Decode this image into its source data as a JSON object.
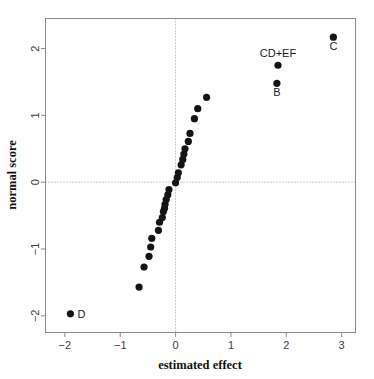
{
  "chart_data": {
    "type": "scatter",
    "title": "",
    "xlabel": "estimated effect",
    "ylabel": "normal score",
    "xlim": [
      -2.35,
      3.25
    ],
    "ylim": [
      -2.25,
      2.45
    ],
    "xticks": [
      -2,
      -1,
      0,
      1,
      2,
      3
    ],
    "xtick_labels": [
      "−2",
      "−1",
      "0",
      "1",
      "2",
      "3"
    ],
    "yticks": [
      -2,
      -1,
      0,
      1,
      2
    ],
    "ytick_labels": [
      "−2",
      "−1",
      "0",
      "1",
      "2"
    ],
    "grid": false,
    "reference_lines": [
      {
        "orientation": "vertical",
        "value": 0,
        "style": "dotted"
      },
      {
        "orientation": "horizontal",
        "value": 0,
        "style": "dotted"
      }
    ],
    "legend": null,
    "point_color": "#141414",
    "frame_color": "#8a8a8a",
    "points": [
      {
        "x": -1.9,
        "y": -1.97,
        "label": "D",
        "label_pos": "right"
      },
      {
        "x": -0.66,
        "y": -1.57,
        "label": "",
        "label_pos": ""
      },
      {
        "x": -0.57,
        "y": -1.27,
        "label": "",
        "label_pos": ""
      },
      {
        "x": -0.48,
        "y": -1.11,
        "label": "",
        "label_pos": ""
      },
      {
        "x": -0.45,
        "y": -0.97,
        "label": "",
        "label_pos": ""
      },
      {
        "x": -0.43,
        "y": -0.84,
        "label": "",
        "label_pos": ""
      },
      {
        "x": -0.31,
        "y": -0.72,
        "label": "",
        "label_pos": ""
      },
      {
        "x": -0.29,
        "y": -0.6,
        "label": "",
        "label_pos": ""
      },
      {
        "x": -0.24,
        "y": -0.53,
        "label": "",
        "label_pos": ""
      },
      {
        "x": -0.22,
        "y": -0.44,
        "label": "",
        "label_pos": ""
      },
      {
        "x": -0.2,
        "y": -0.39,
        "label": "",
        "label_pos": ""
      },
      {
        "x": -0.19,
        "y": -0.33,
        "label": "",
        "label_pos": ""
      },
      {
        "x": -0.17,
        "y": -0.26,
        "label": "",
        "label_pos": ""
      },
      {
        "x": -0.14,
        "y": -0.19,
        "label": "",
        "label_pos": ""
      },
      {
        "x": -0.12,
        "y": -0.11,
        "label": "",
        "label_pos": ""
      },
      {
        "x": 0.0,
        "y": -0.01,
        "label": "",
        "label_pos": ""
      },
      {
        "x": 0.03,
        "y": 0.07,
        "label": "",
        "label_pos": ""
      },
      {
        "x": 0.05,
        "y": 0.14,
        "label": "",
        "label_pos": ""
      },
      {
        "x": 0.1,
        "y": 0.26,
        "label": "",
        "label_pos": ""
      },
      {
        "x": 0.13,
        "y": 0.34,
        "label": "",
        "label_pos": ""
      },
      {
        "x": 0.15,
        "y": 0.42,
        "label": "",
        "label_pos": ""
      },
      {
        "x": 0.17,
        "y": 0.5,
        "label": "",
        "label_pos": ""
      },
      {
        "x": 0.23,
        "y": 0.61,
        "label": "",
        "label_pos": ""
      },
      {
        "x": 0.26,
        "y": 0.73,
        "label": "",
        "label_pos": ""
      },
      {
        "x": 0.34,
        "y": 0.95,
        "label": "",
        "label_pos": ""
      },
      {
        "x": 0.4,
        "y": 1.1,
        "label": "",
        "label_pos": ""
      },
      {
        "x": 0.56,
        "y": 1.27,
        "label": "",
        "label_pos": ""
      },
      {
        "x": 1.83,
        "y": 1.48,
        "label": "B",
        "label_pos": "below"
      },
      {
        "x": 1.85,
        "y": 1.75,
        "label": "CD+EF",
        "label_pos": "above"
      },
      {
        "x": 2.85,
        "y": 2.17,
        "label": "C",
        "label_pos": "below"
      }
    ]
  }
}
